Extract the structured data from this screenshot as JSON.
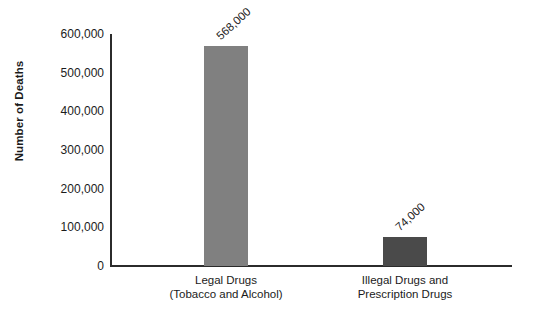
{
  "chart_data": {
    "type": "bar",
    "title": "",
    "subtitle": "",
    "xlabel": "",
    "ylabel": "Number of Deaths",
    "ylim": [
      0,
      600000
    ],
    "grid": false,
    "legend": null,
    "categories": [
      "Legal Drugs (Tobacco and Alcohol)",
      "Illegal Drugs and Prescription Drugs"
    ],
    "category_lines": [
      [
        "Legal Drugs",
        "(Tobacco and Alcohol)"
      ],
      [
        "Illegal Drugs and",
        "Prescription Drugs"
      ]
    ],
    "values": [
      568000,
      74000
    ],
    "value_labels": [
      "568,000",
      "74,000"
    ],
    "bar_colors": [
      "#808080",
      "#4a4a4a"
    ],
    "ytick_values": [
      600000,
      500000,
      400000,
      300000,
      200000,
      100000,
      0
    ],
    "ytick_labels": [
      "600,000",
      "500,000",
      "400,000",
      "300,000",
      "200,000",
      "100,000",
      "0"
    ],
    "axis_color": "#2b2b2b",
    "text_color": "#1b1b1b",
    "background": "#ffffff"
  }
}
